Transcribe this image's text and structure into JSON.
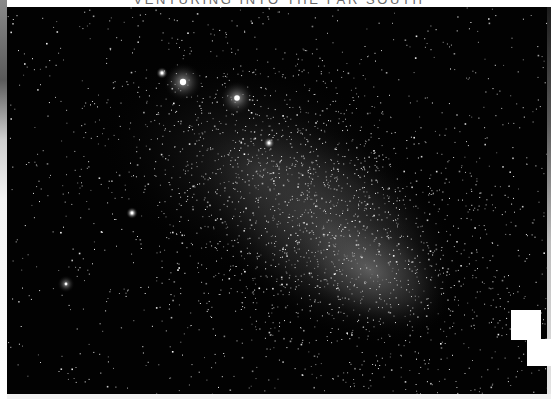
{
  "header": {
    "title": "VENTURING INTO THE FAR SOUTH"
  },
  "photo": {
    "subject": "Small Magellanic Cloud starfield",
    "background_color": "#020202",
    "bright_objects": [
      {
        "name": "globular-cluster",
        "x": 183,
        "y": 82,
        "r": 9
      },
      {
        "name": "bright-cluster",
        "x": 237,
        "y": 98,
        "r": 8
      },
      {
        "name": "star",
        "x": 162,
        "y": 73,
        "r": 3
      },
      {
        "name": "star",
        "x": 269,
        "y": 143,
        "r": 3
      },
      {
        "name": "star",
        "x": 132,
        "y": 213,
        "r": 3
      },
      {
        "name": "small-cluster",
        "x": 66,
        "y": 284,
        "r": 4
      }
    ]
  },
  "overlays": {
    "block_1": {
      "x": 511,
      "y": 310,
      "w": 30,
      "h": 30,
      "color": "#ffffff"
    },
    "block_2": {
      "x": 527,
      "y": 339,
      "w": 24,
      "h": 27,
      "color": "#ffffff"
    }
  }
}
